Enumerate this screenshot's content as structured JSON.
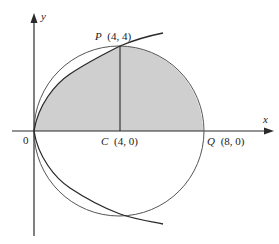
{
  "figure": {
    "type": "geometry-diagram",
    "colors": {
      "stroke": "#2a2a2a",
      "circle_stroke": "#555555",
      "shade": "#cfcfcf",
      "background": "#ffffff"
    },
    "axes": {
      "x_label": "x",
      "y_label": "y"
    },
    "points": {
      "origin": {
        "label": "0",
        "x": 0,
        "y": 0
      },
      "P": {
        "name": "P",
        "coords": "(4, 4)",
        "x": 4,
        "y": 4
      },
      "C": {
        "name": "C",
        "coords": "(4, 0)",
        "x": 4,
        "y": 0
      },
      "Q": {
        "name": "Q",
        "coords": "(8, 0)",
        "x": 8,
        "y": 0
      }
    },
    "curves": [
      {
        "name": "circle",
        "equation": "(x-4)^2 + y^2 = 16",
        "center": [
          4,
          0
        ],
        "radius": 4
      },
      {
        "name": "parabola",
        "equation": "y^2 = 4x"
      },
      {
        "name": "segment-PC",
        "from": [
          4,
          4
        ],
        "to": [
          4,
          0
        ]
      }
    ]
  }
}
